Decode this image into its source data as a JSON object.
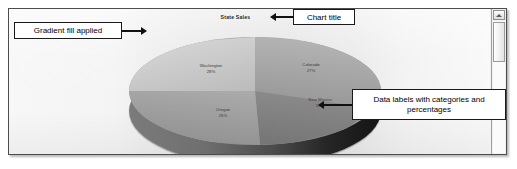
{
  "chart_data": {
    "type": "pie",
    "title": "State Sales",
    "three_d": true,
    "categories": [
      "Washington",
      "Colorado",
      "New Mexico",
      "Oregon"
    ],
    "values": [
      28,
      27,
      19,
      26
    ],
    "labels": [
      {
        "name": "Washington",
        "percent": "28%"
      },
      {
        "name": "Colorado",
        "percent": "27%"
      },
      {
        "name": "New Mexico",
        "percent": "19%"
      },
      {
        "name": "Oregon",
        "percent": "26%"
      }
    ],
    "legend": "none",
    "data_label_format": "category name and percentage",
    "grid": false,
    "xlabel": "",
    "ylabel": ""
  },
  "panel": {
    "background_gradient": true,
    "border_color": "#4d4d4d"
  },
  "annotations": [
    {
      "id": "gradient-fill",
      "text": "Gradient fill applied",
      "arrow": "right"
    },
    {
      "id": "chart-title",
      "text": "Chart title",
      "arrow": "left"
    },
    {
      "id": "data-labels",
      "text": "Data labels with categories and percentages",
      "arrow": "left"
    }
  ],
  "scrollbar": {
    "up_arrow_icon": "triangle-up-icon",
    "orientation": "vertical",
    "position": "right"
  }
}
